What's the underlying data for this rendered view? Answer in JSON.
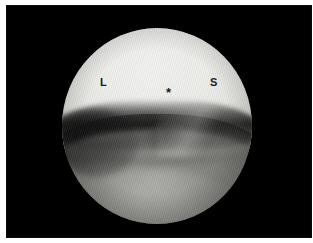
{
  "figure": {
    "kind": "arthroscopic-photograph",
    "modality": "knee arthroscopy",
    "frame": {
      "plate_color": "#000000",
      "page_color": "#ffffff"
    }
  },
  "scope": {
    "shape": "circle",
    "upper_structure": "femoral condyle",
    "lower_structure": "tibial plateau and meniscus",
    "colors": {
      "condyle_highlight": "#f2f2f0",
      "condyle_midtone": "#e3e3df",
      "joint_line_shadow": "#0e0e0e",
      "plateau_midtone": "#8c8c88",
      "plateau_shadow": "#3a3a38",
      "background": "#000000",
      "annotation": "#1b1b1b"
    }
  },
  "annotations": [
    {
      "id": "lateral",
      "text": "L",
      "x": 94,
      "y": 72
    },
    {
      "id": "asterisk",
      "text": "*",
      "x": 160,
      "y": 81
    },
    {
      "id": "superior",
      "text": "S",
      "x": 204,
      "y": 72
    }
  ]
}
